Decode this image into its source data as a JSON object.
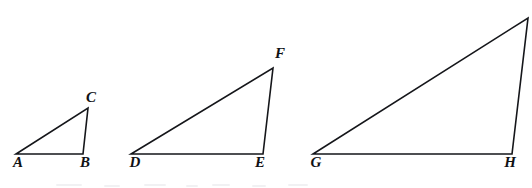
{
  "figure": {
    "background_color": "#ffffff",
    "stroke_color": "#15161a",
    "label_color": "#101114",
    "width": 532,
    "height": 188
  },
  "triangles": [
    {
      "id": "triangle-abc",
      "name": "Triangle ABC",
      "size_rank": "small",
      "vertices": [
        {
          "label": "A",
          "role": "bottom-left",
          "point_x": 16,
          "point_y": 154,
          "label_x": 18,
          "label_y": 162
        },
        {
          "label": "B",
          "role": "bottom-right",
          "point_x": 83,
          "point_y": 154,
          "label_x": 85,
          "label_y": 162
        },
        {
          "label": "C",
          "role": "apex",
          "point_x": 88,
          "point_y": 108,
          "label_x": 91,
          "label_y": 97
        }
      ],
      "base_length": 67,
      "height": 46,
      "path": "M 16 154 L 83 154 L 88 108 Z"
    },
    {
      "id": "triangle-def",
      "name": "Triangle DEF",
      "size_rank": "medium",
      "vertices": [
        {
          "label": "D",
          "role": "bottom-left",
          "point_x": 131,
          "point_y": 154,
          "label_x": 135,
          "label_y": 162
        },
        {
          "label": "E",
          "role": "bottom-right",
          "point_x": 263,
          "point_y": 154,
          "label_x": 260,
          "label_y": 162
        },
        {
          "label": "F",
          "role": "apex",
          "point_x": 273,
          "point_y": 68,
          "label_x": 280,
          "label_y": 53
        }
      ],
      "base_length": 132,
      "height": 86,
      "path": "M 131 154 L 263 154 L 273 68 Z"
    },
    {
      "id": "triangle-ghi",
      "name": "Triangle GH (apex cropped)",
      "size_rank": "large",
      "vertices": [
        {
          "label": "G",
          "role": "bottom-left",
          "point_x": 313,
          "point_y": 154,
          "label_x": 316,
          "label_y": 162
        },
        {
          "label": "H",
          "role": "bottom-right",
          "point_x": 512,
          "point_y": 154,
          "label_x": 510,
          "label_y": 162
        },
        {
          "label": "",
          "role": "apex",
          "point_x": 528,
          "point_y": 18,
          "label_x": null,
          "label_y": null
        }
      ],
      "base_length": 199,
      "height": 136,
      "path": "M 313 154 L 512 154 L 528 18 Z"
    }
  ],
  "typography": {
    "label_font_size_px": 15,
    "stroke_width_px": 1.6
  }
}
